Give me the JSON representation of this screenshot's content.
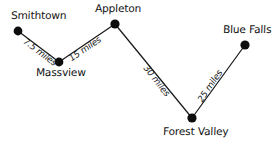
{
  "figure": {
    "type": "node-link-map",
    "width": 277,
    "height": 148,
    "background_color": "#ffffff",
    "line_color": "#1a1a1a",
    "node_color": "#0d0d0d",
    "distance_unit": "miles"
  },
  "nodes": [
    {
      "id": "smithtown",
      "label": "Smithtown",
      "x": 18,
      "y": 31,
      "r": 4.4,
      "label_x": 11,
      "label_y": 10
    },
    {
      "id": "massview",
      "label": "Massview",
      "x": 59,
      "y": 62,
      "r": 4.4,
      "label_x": 36,
      "label_y": 67
    },
    {
      "id": "appleton",
      "label": "Appleton",
      "x": 115,
      "y": 24,
      "r": 4.6,
      "label_x": 95,
      "label_y": 3
    },
    {
      "id": "forest_valley",
      "label": "Forest Valley",
      "x": 192,
      "y": 118,
      "r": 4.6,
      "label_x": 163,
      "label_y": 126
    },
    {
      "id": "blue_falls",
      "label": "Blue Falls",
      "x": 245,
      "y": 45,
      "r": 4.6,
      "label_x": 223,
      "label_y": 24
    }
  ],
  "edges": [
    {
      "id": "smithtown-massview",
      "from": "smithtown",
      "to": "massview",
      "distance": 7.5,
      "label": "7.5 miles",
      "label_x": 24,
      "label_y": 36,
      "label_rotation": 37
    },
    {
      "id": "massview-appleton",
      "from": "massview",
      "to": "appleton",
      "distance": 15,
      "label": "15 miles",
      "label_x": 70,
      "label_y": 55,
      "label_rotation": -34
    },
    {
      "id": "appleton-forest-valley",
      "from": "appleton",
      "to": "forest_valley",
      "distance": 30,
      "label": "30 miles",
      "label_x": 145,
      "label_y": 62,
      "label_rotation": 52
    },
    {
      "id": "forest-valley-blue-falls",
      "from": "forest_valley",
      "to": "blue_falls",
      "distance": 25,
      "label": "25 miles",
      "label_x": 200,
      "label_y": 97,
      "label_rotation": -56
    }
  ]
}
